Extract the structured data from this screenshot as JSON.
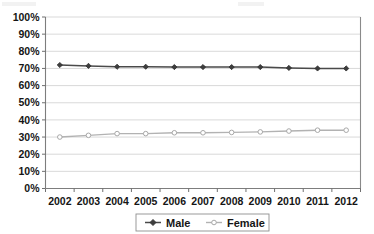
{
  "chart_data": {
    "type": "line",
    "title": "",
    "subtitle": "",
    "xlabel": "",
    "ylabel": "",
    "categories": [
      "2002",
      "2003",
      "2004",
      "2005",
      "2006",
      "2007",
      "2008",
      "2009",
      "2010",
      "2011",
      "2012"
    ],
    "series": [
      {
        "name": "Male",
        "color": "#4a4a4a",
        "marker": "filled-diamond",
        "values": [
          72,
          71.5,
          71,
          71,
          70.8,
          70.8,
          70.8,
          70.8,
          70.3,
          70,
          70
        ]
      },
      {
        "name": "Female",
        "color": "#b2b2b2",
        "marker": "open-circle",
        "values": [
          30,
          31,
          32,
          32,
          32.5,
          32.5,
          32.7,
          33,
          33.5,
          34,
          34
        ]
      }
    ],
    "ylim": [
      0,
      100
    ],
    "yticks": [
      0,
      10,
      20,
      30,
      40,
      50,
      60,
      70,
      80,
      90,
      100
    ],
    "ytick_labels": [
      "0%",
      "10%",
      "20%",
      "30%",
      "40%",
      "50%",
      "60%",
      "70%",
      "80%",
      "90%",
      "100%"
    ],
    "xtick_labels": [
      "2002",
      "2003",
      "2004",
      "2005",
      "2006",
      "2007",
      "2008",
      "2009",
      "2010",
      "2011",
      "2012"
    ],
    "grid": true,
    "grid_axis": "y",
    "legend_position": "bottom-center",
    "legend_entries": [
      "Male",
      "Female"
    ],
    "value_suffix": "%"
  },
  "legend": {
    "male_label": "Male",
    "female_label": "Female"
  },
  "axis": {
    "y_labels": [
      "100%",
      "90%",
      "80%",
      "70%",
      "60%",
      "50%",
      "40%",
      "30%",
      "20%",
      "10%",
      "0%"
    ],
    "x_labels": [
      "2002",
      "2003",
      "2004",
      "2005",
      "2006",
      "2007",
      "2008",
      "2009",
      "2010",
      "2011",
      "2012"
    ]
  }
}
